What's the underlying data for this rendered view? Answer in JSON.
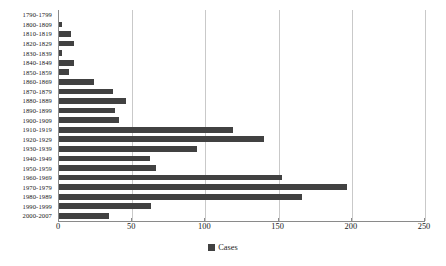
{
  "chart_data": {
    "type": "bar",
    "orientation": "horizontal",
    "title": "",
    "xlabel": "",
    "ylabel": "",
    "xlim": [
      0,
      250
    ],
    "xticks": [
      0,
      50,
      100,
      150,
      200,
      250
    ],
    "grid": true,
    "legend": {
      "position": "bottom",
      "entries": [
        "Cases"
      ]
    },
    "series_name": "Cases",
    "bar_color": "#414141",
    "categories": [
      "1790-1799",
      "1800-1809",
      "1810-1819",
      "1820-1829",
      "1830-1839",
      "1840-1849",
      "1850-1859",
      "1860-1869",
      "1870-1879",
      "1880-1889",
      "1890-1899",
      "1900-1909",
      "1910-1919",
      "1920-1929",
      "1930-1939",
      "1940-1949",
      "1950-1959",
      "1960-1969",
      "1970-1979",
      "1980-1989",
      "1990-1999",
      "2000-2007"
    ],
    "values": [
      0,
      2,
      8,
      10,
      2,
      10,
      7,
      24,
      37,
      46,
      38,
      41,
      119,
      140,
      94,
      62,
      66,
      152,
      197,
      166,
      63,
      34
    ]
  }
}
